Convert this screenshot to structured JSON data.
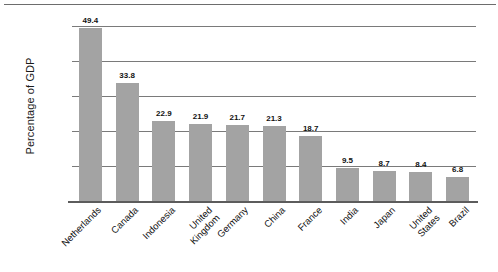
{
  "chart_data": {
    "type": "bar",
    "title": "",
    "xlabel": "",
    "ylabel": "Percentage of GDP",
    "ylim": [
      0,
      50
    ],
    "yticks": [
      0,
      10,
      20,
      30,
      40,
      50
    ],
    "grid": true,
    "legend": null,
    "bar_color": "#a3a3a3",
    "categories": [
      "Netherlands",
      "Canada",
      "Indonesia",
      "United\nKingdom",
      "Germany",
      "China",
      "France",
      "India",
      "Japan",
      "United\nStates",
      "Brazil"
    ],
    "values": [
      49.4,
      33.8,
      22.9,
      21.9,
      21.7,
      21.3,
      18.7,
      9.5,
      8.7,
      8.4,
      6.8
    ],
    "value_labels": [
      "49.4",
      "33.8",
      "22.9",
      "21.9",
      "21.7",
      "21.3",
      "18.7",
      "9.5",
      "8.7",
      "8.4",
      "6.8"
    ]
  },
  "axis": {
    "y_title": "Percentage of GDP",
    "y_tick_labels": [
      "50",
      "40",
      "30",
      "20",
      "10",
      "0"
    ]
  }
}
